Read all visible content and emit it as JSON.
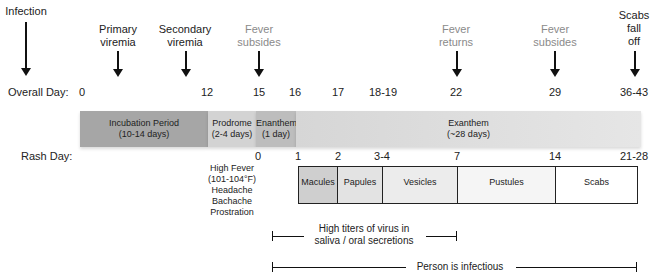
{
  "events": [
    {
      "label": "Infection",
      "lines": [
        "Infection"
      ],
      "color": "#111111"
    },
    {
      "label": "Primary viremia",
      "lines": [
        "Primary",
        "viremia"
      ],
      "color": "#111111"
    },
    {
      "label": "Secondary viremia",
      "lines": [
        "Secondary",
        "viremia"
      ],
      "color": "#111111"
    },
    {
      "label": "Fever subsides",
      "lines": [
        "Fever",
        "subsides"
      ],
      "color": "#8a8a8a"
    },
    {
      "label": "Fever returns",
      "lines": [
        "Fever",
        "returns"
      ],
      "color": "#8a8a8a"
    },
    {
      "label": "Fever subsides",
      "lines": [
        "Fever",
        "subsides"
      ],
      "color": "#8a8a8a"
    },
    {
      "label": "Scabs fall off",
      "lines": [
        "Scabs",
        "fall",
        "off"
      ],
      "color": "#111111"
    }
  ],
  "overall_day": {
    "label": "Overall Day:",
    "ticks": [
      "0",
      "12",
      "15",
      "16",
      "17",
      "18-19",
      "22",
      "29",
      "36-43"
    ]
  },
  "phases": [
    {
      "name": "Incubation Period",
      "duration": "(10-14 days)",
      "color": "#a6a6a6"
    },
    {
      "name": "Prodrome",
      "duration": "(2-4 days)",
      "color": "#d3d3d3"
    },
    {
      "name": "Enanthem",
      "duration": "(1 day)",
      "color": "#bdbdbd"
    },
    {
      "name": "Exanthem",
      "duration": "(~28 days)",
      "color": "#dedede"
    }
  ],
  "rash_day": {
    "label": "Rash Day:",
    "ticks": [
      "0",
      "1",
      "2",
      "3-4",
      "7",
      "14",
      "21-28"
    ]
  },
  "prodrome_symptoms": [
    "High Fever",
    "(101-104°F)",
    "Headache",
    "Bachache",
    "Prostration"
  ],
  "rash_stages": [
    {
      "name": "Macules",
      "color": "#cfcfcf"
    },
    {
      "name": "Papules",
      "color": "#e3e3e3"
    },
    {
      "name": "Vesicles",
      "color": "#ececec"
    },
    {
      "name": "Pustules",
      "color": "#f5f5f5"
    },
    {
      "name": "Scabs",
      "color": "#ffffff"
    }
  ],
  "ranges": {
    "high_titers": {
      "line1": "High titers of virus in",
      "line2": "saliva / oral secretions"
    },
    "infectious": {
      "label": "Person is infectious"
    }
  }
}
